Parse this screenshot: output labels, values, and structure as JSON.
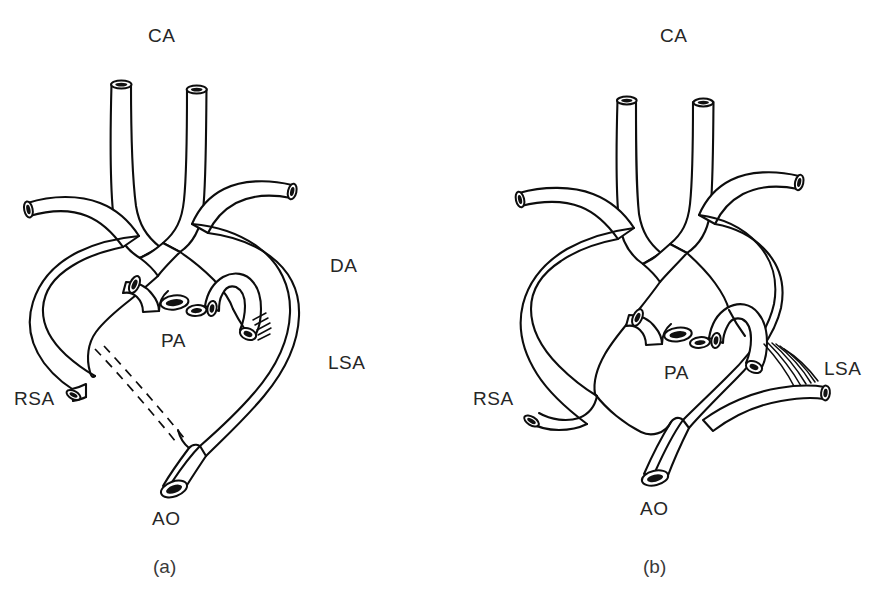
{
  "figure": {
    "type": "anatomical-line-diagram",
    "background_color": "#ffffff",
    "line_color": "#0d0d0d",
    "panel_count": 2
  },
  "panels": [
    {
      "id": "a",
      "caption": "(a)",
      "labels": {
        "ca": "CA",
        "da": "DA",
        "pa": "PA",
        "lsa": "LSA",
        "rsa": "RSA",
        "ao": "AO"
      },
      "features": {
        "atretic_segment": "dashed",
        "ligament_hatching": "short",
        "subclavian_origin": "arch"
      }
    },
    {
      "id": "b",
      "caption": "(b)",
      "labels": {
        "ca": "CA",
        "pa": "PA",
        "lsa": "LSA",
        "rsa": "RSA",
        "ao": "AO"
      },
      "features": {
        "atretic_segment": "none",
        "ligament_hatching": "long-fan",
        "subclavian_origin": "descending-aorta"
      }
    }
  ],
  "legend_terms": {
    "CA": "CA",
    "DA": "DA",
    "PA": "PA",
    "LSA": "LSA",
    "RSA": "RSA",
    "AO": "AO"
  }
}
